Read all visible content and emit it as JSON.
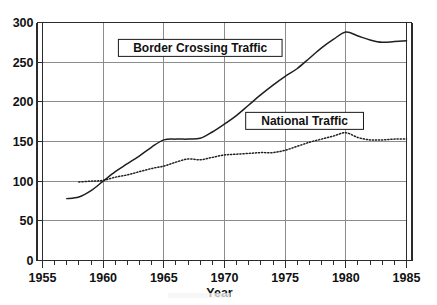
{
  "chart_data": {
    "type": "line",
    "title": "",
    "xlabel": "Year",
    "ylabel": "",
    "xlim": [
      1955,
      1985
    ],
    "ylim": [
      0,
      300
    ],
    "xticks": [
      1955,
      1960,
      1965,
      1970,
      1975,
      1980,
      1985
    ],
    "yticks": [
      0,
      50,
      100,
      150,
      200,
      250,
      300
    ],
    "xtick_labels": [
      "1955",
      "1960",
      "1965",
      "1970",
      "1975",
      "1980",
      "1985"
    ],
    "ytick_labels": [
      "0",
      "50",
      "100",
      "150",
      "200",
      "250",
      "300"
    ],
    "minor_xtick_step": 1,
    "grid": true,
    "legend_position": "inline-annotations",
    "series": [
      {
        "name": "Border Crossing Traffic",
        "style": "solid",
        "x": [
          1957,
          1958,
          1959,
          1960,
          1961,
          1962,
          1963,
          1964,
          1965,
          1966,
          1967,
          1968,
          1969,
          1970,
          1971,
          1972,
          1973,
          1974,
          1975,
          1976,
          1977,
          1978,
          1979,
          1980,
          1981,
          1982,
          1983,
          1984,
          1985
        ],
        "values": [
          78,
          80,
          88,
          100,
          112,
          122,
          132,
          143,
          152,
          153,
          153,
          154,
          162,
          172,
          183,
          196,
          209,
          221,
          232,
          242,
          255,
          268,
          279,
          288,
          283,
          278,
          275,
          276,
          277
        ]
      },
      {
        "name": "National Traffic",
        "style": "dotted",
        "x": [
          1958,
          1959,
          1960,
          1961,
          1962,
          1963,
          1964,
          1965,
          1966,
          1967,
          1968,
          1969,
          1970,
          1971,
          1972,
          1973,
          1974,
          1975,
          1976,
          1977,
          1978,
          1979,
          1980,
          1981,
          1982,
          1983,
          1984,
          1985
        ],
        "values": [
          99,
          100,
          101,
          105,
          108,
          112,
          116,
          119,
          124,
          128,
          127,
          130,
          133,
          134,
          135,
          136,
          136,
          139,
          144,
          149,
          153,
          157,
          161,
          155,
          152,
          152,
          153,
          153
        ]
      }
    ],
    "annotations": [
      {
        "text": "Border Crossing Traffic",
        "x": 1968.0,
        "y": 268,
        "boxed": true
      },
      {
        "text": "National Traffic",
        "x": 1976.6,
        "y": 176,
        "boxed": true
      }
    ]
  },
  "colors": {
    "background": "#ffffff",
    "line": "#1f1f1f",
    "grid": "#8c8c8c",
    "axis": "#2b2b2b",
    "text": "#111111"
  }
}
